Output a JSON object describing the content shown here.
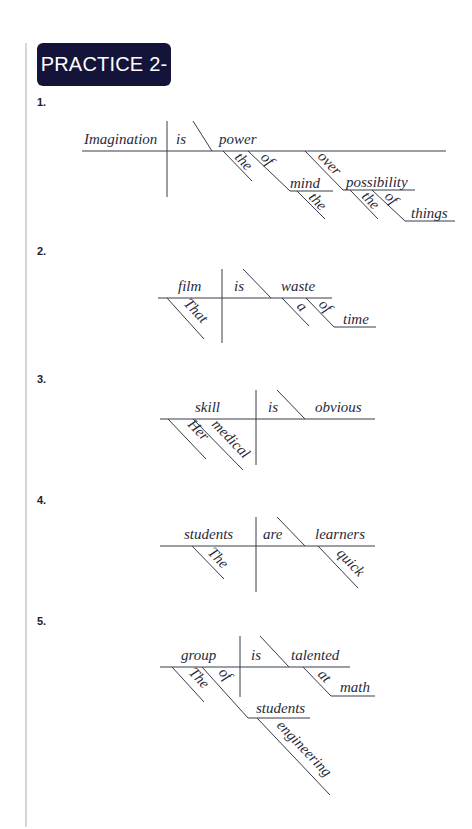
{
  "heading": "PRACTICE 2-13",
  "colors": {
    "badge_bg": "#14143b",
    "badge_text": "#ffffff",
    "lines": "#3a3a4a"
  },
  "items": [
    {
      "number": "1.",
      "sentence_words": {
        "subject": "Imagination",
        "verb": "is",
        "complement": "power",
        "mod_the_1": "the",
        "prep_of_1": "of",
        "obj_mind": "mind",
        "mod_the_2": "the",
        "prep_over": "over",
        "obj_possibility": "possibility",
        "mod_the_3": "the",
        "prep_of_2": "of",
        "obj_things": "things"
      }
    },
    {
      "number": "2.",
      "sentence_words": {
        "subject": "film",
        "mod_that": "That",
        "verb": "is",
        "complement": "waste",
        "mod_a": "a",
        "prep_of": "of",
        "obj_time": "time"
      }
    },
    {
      "number": "3.",
      "sentence_words": {
        "subject": "skill",
        "mod_her": "Her",
        "mod_medical": "medical",
        "verb": "is",
        "complement": "obvious"
      }
    },
    {
      "number": "4.",
      "sentence_words": {
        "subject": "students",
        "mod_the": "The",
        "verb": "are",
        "complement": "learners",
        "mod_quick": "quick"
      }
    },
    {
      "number": "5.",
      "sentence_words": {
        "subject": "group",
        "mod_the": "The",
        "prep_of": "of",
        "obj_students": "students",
        "mod_engineering": "engineering",
        "verb": "is",
        "complement": "talented",
        "prep_at": "at",
        "obj_math": "math"
      }
    }
  ]
}
